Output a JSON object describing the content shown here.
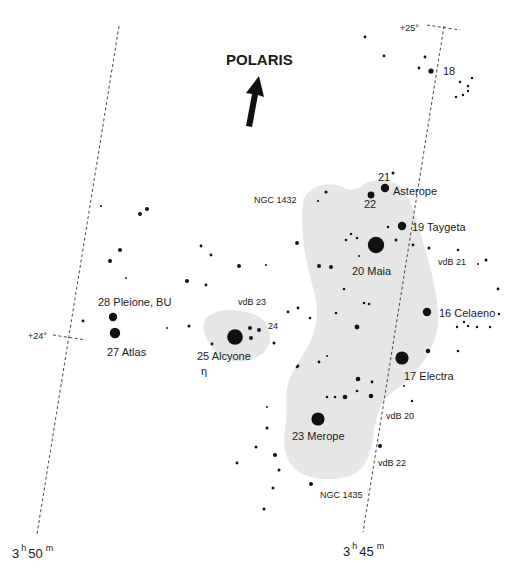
{
  "direction_marker": {
    "label": "POLARIS",
    "icon": "arrow-up-icon"
  },
  "grid": {
    "ra_lines": [
      {
        "label_h": "3",
        "label_hsup": "h",
        "label_m": "50",
        "label_msup": "m"
      },
      {
        "label_h": "3",
        "label_hsup": "h",
        "label_m": "45",
        "label_msup": "m"
      }
    ],
    "dec_ticks": [
      {
        "label": "+25°"
      },
      {
        "label": "+24°"
      }
    ]
  },
  "colors": {
    "nebula": "#e6e6e6",
    "star": "#111111",
    "grid": "#333333",
    "background": "#ffffff"
  },
  "named_stars": [
    {
      "id": "18",
      "label": "18"
    },
    {
      "id": "21",
      "label": "21"
    },
    {
      "id": "asterope",
      "label": "Asterope"
    },
    {
      "id": "22",
      "label": "22"
    },
    {
      "id": "taygeta",
      "label": "19 Taygeta"
    },
    {
      "id": "maia",
      "label": "20  Maia"
    },
    {
      "id": "celaeno",
      "label": "16  Celaeno"
    },
    {
      "id": "electra",
      "label": "17  Electra"
    },
    {
      "id": "merope",
      "label": "23 Merope"
    },
    {
      "id": "alcyone",
      "label": "25  Alcyone"
    },
    {
      "id": "alcyone_greek",
      "label": "η"
    },
    {
      "id": "24",
      "label": "24"
    },
    {
      "id": "pleione",
      "label": "28  Pleione, BU"
    },
    {
      "id": "atlas",
      "label": "27  Atlas"
    }
  ],
  "objects": [
    {
      "id": "ngc1432",
      "label": "NGC 1432"
    },
    {
      "id": "ngc1435",
      "label": "NGC 1435"
    },
    {
      "id": "vdb20",
      "label": "vdB 20"
    },
    {
      "id": "vdb21",
      "label": "vdB 21"
    },
    {
      "id": "vdb22",
      "label": "vdB 22"
    },
    {
      "id": "vdb23",
      "label": "vdB 23"
    }
  ]
}
